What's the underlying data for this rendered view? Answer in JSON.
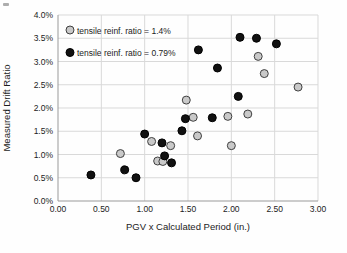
{
  "chart_data": {
    "type": "scatter",
    "title": "",
    "xlabel": "PGV x Calculated Period (in.)",
    "ylabel": "Measured Drift Ratio",
    "xlim": [
      0.0,
      3.0
    ],
    "ylim": [
      0.0,
      4.0
    ],
    "x_ticks": [
      0.0,
      0.5,
      1.0,
      1.5,
      2.0,
      2.5,
      3.0
    ],
    "x_tick_labels": [
      "0.00",
      "0.50",
      "1.00",
      "1.50",
      "2.00",
      "2.50",
      "3.00"
    ],
    "y_ticks": [
      0.0,
      0.5,
      1.0,
      1.5,
      2.0,
      2.5,
      3.0,
      3.5,
      4.0
    ],
    "y_tick_labels": [
      "0.0%",
      "0.5%",
      "1.0%",
      "1.5%",
      "2.0%",
      "2.5%",
      "3.0%",
      "3.5%",
      "4.0%"
    ],
    "grid": true,
    "legend_position": "top-left-inside",
    "series": [
      {
        "name": "tensile reinf. ratio = 1.4%",
        "marker_fill": "#c9c9c9",
        "marker_stroke": "#404040",
        "points": [
          [
            0.72,
            1.02
          ],
          [
            1.08,
            1.28
          ],
          [
            1.15,
            0.86
          ],
          [
            1.21,
            0.85
          ],
          [
            1.3,
            1.19
          ],
          [
            1.48,
            2.17
          ],
          [
            1.56,
            1.8
          ],
          [
            1.61,
            1.4
          ],
          [
            1.96,
            1.82
          ],
          [
            2.0,
            1.19
          ],
          [
            2.19,
            1.87
          ],
          [
            2.31,
            3.11
          ],
          [
            2.38,
            2.74
          ],
          [
            2.77,
            2.45
          ]
        ]
      },
      {
        "name": "tensile reinf. ratio = 0.79%",
        "marker_fill": "#111111",
        "marker_stroke": "#000000",
        "points": [
          [
            0.38,
            0.56
          ],
          [
            0.77,
            0.67
          ],
          [
            0.9,
            0.5
          ],
          [
            1.0,
            1.44
          ],
          [
            1.2,
            1.25
          ],
          [
            1.23,
            0.97
          ],
          [
            1.31,
            0.82
          ],
          [
            1.43,
            1.51
          ],
          [
            1.47,
            1.77
          ],
          [
            1.62,
            3.25
          ],
          [
            1.78,
            1.79
          ],
          [
            1.84,
            2.86
          ],
          [
            2.08,
            2.25
          ],
          [
            2.1,
            3.52
          ],
          [
            2.29,
            3.5
          ],
          [
            2.52,
            3.38
          ]
        ]
      }
    ]
  }
}
